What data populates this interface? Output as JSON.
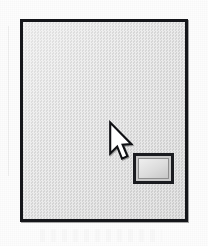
{
  "figure": {
    "kind": "scanned-grayscale-figure",
    "caption": "",
    "window": {
      "label": "",
      "client_area_label": "",
      "border_color": "#15161a",
      "client_fill_color": "#d3d3d3",
      "page_background_color": "#fdfdfd"
    },
    "icons": [
      {
        "name": "display-icon",
        "label": "",
        "border_color": "#1b1c20",
        "screen_fill_color": "#e2e2e2"
      },
      {
        "name": "mouse-pointer-icon",
        "label": "",
        "fill_color": "#ffffff",
        "outline_color": "#101114"
      }
    ]
  }
}
